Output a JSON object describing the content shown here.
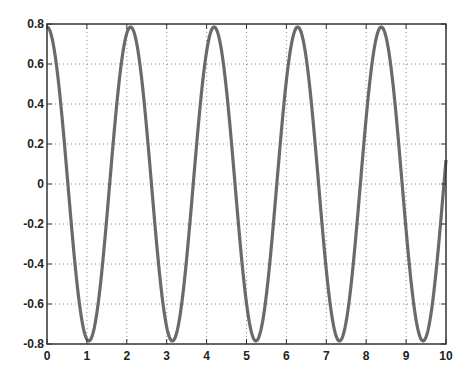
{
  "chart_data": {
    "type": "line",
    "title": "",
    "xlabel": "",
    "ylabel": "",
    "xlim": [
      0,
      10
    ],
    "ylim": [
      -0.8,
      0.8
    ],
    "grid": true,
    "grid_style": "dotted",
    "legend": null,
    "x_ticks": [
      0,
      1,
      2,
      3,
      4,
      5,
      6,
      7,
      8,
      9,
      10
    ],
    "x_tick_labels": [
      "0",
      "1",
      "2",
      "3",
      "4",
      "5",
      "6",
      "7",
      "8",
      "9",
      "10"
    ],
    "y_ticks": [
      0.8,
      0.6,
      0.4,
      0.2,
      0,
      -0.2,
      -0.4,
      -0.6,
      -0.8
    ],
    "y_tick_labels": [
      "0.8",
      "0.6",
      "0.4",
      "0.2",
      "0",
      "-0.2",
      "-0.4",
      "-0.6",
      "-0.8"
    ],
    "series": [
      {
        "name": "signal",
        "color": "#666666",
        "description": "cosine wave, amplitude ~0.785, period ~2.09 (approx 0.785*cos(3x))",
        "amplitude": 0.785,
        "angular_frequency": 3,
        "x": [
          0,
          0.5,
          1.0,
          1.047,
          1.5,
          2.0,
          2.094,
          2.5,
          3.0,
          3.142,
          3.5,
          4.0,
          4.189,
          4.5,
          5.0,
          5.236,
          5.5,
          6.0,
          6.283,
          6.5,
          7.0,
          7.33,
          7.5,
          8.0,
          8.378,
          8.5,
          9.0,
          9.425,
          9.5,
          10.0
        ],
        "y": [
          0.785,
          0.056,
          -0.777,
          -0.785,
          -0.166,
          0.754,
          0.785,
          0.273,
          -0.715,
          -0.785,
          -0.374,
          0.661,
          0.785,
          0.468,
          -0.597,
          -0.785,
          -0.555,
          0.518,
          0.785,
          0.633,
          -0.43,
          -0.785,
          -0.7,
          0.333,
          0.785,
          0.754,
          -0.23,
          -0.785,
          -0.782,
          0.121
        ]
      }
    ],
    "peaks_x": [
      0,
      2.094,
      4.189,
      6.283,
      8.378
    ],
    "troughs_x": [
      1.047,
      3.142,
      5.236,
      7.33,
      9.425
    ]
  },
  "style": {
    "axis_color": "#333333",
    "grid_color": "#888888",
    "line_color": "#6a6a6a",
    "background": "#ffffff"
  }
}
